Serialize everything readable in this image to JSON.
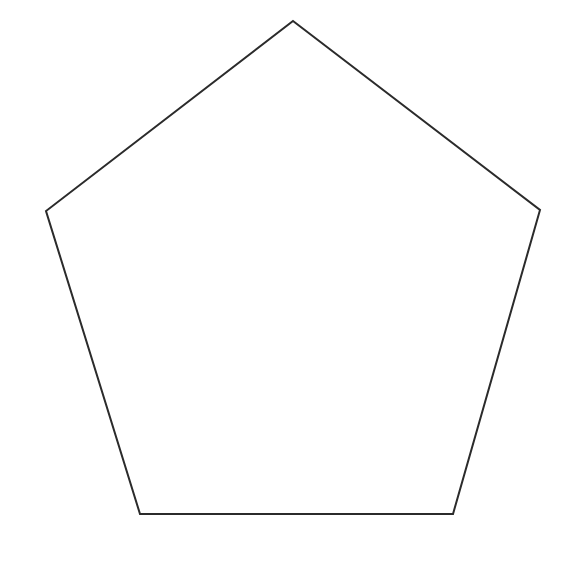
{
  "canvas": {
    "width": 570,
    "height": 574,
    "background_color": "#ffffff",
    "alt_text": "Outline drawing of a regular pentagon"
  },
  "shape": {
    "name": "pentagon",
    "type": "polygon",
    "sides": 5,
    "filled": false,
    "fill_color": "none",
    "stroke_color": "#2b2b2b",
    "stroke_width": 2,
    "points_string": "293,21 540,210 453,514 140,514 46,211",
    "vertices": [
      {
        "label": "apex",
        "x": 293,
        "y": 21
      },
      {
        "label": "right",
        "x": 540,
        "y": 210
      },
      {
        "label": "bottom-right",
        "x": 453,
        "y": 514
      },
      {
        "label": "bottom-left",
        "x": 140,
        "y": 514
      },
      {
        "label": "left",
        "x": 46,
        "y": 211
      }
    ]
  }
}
